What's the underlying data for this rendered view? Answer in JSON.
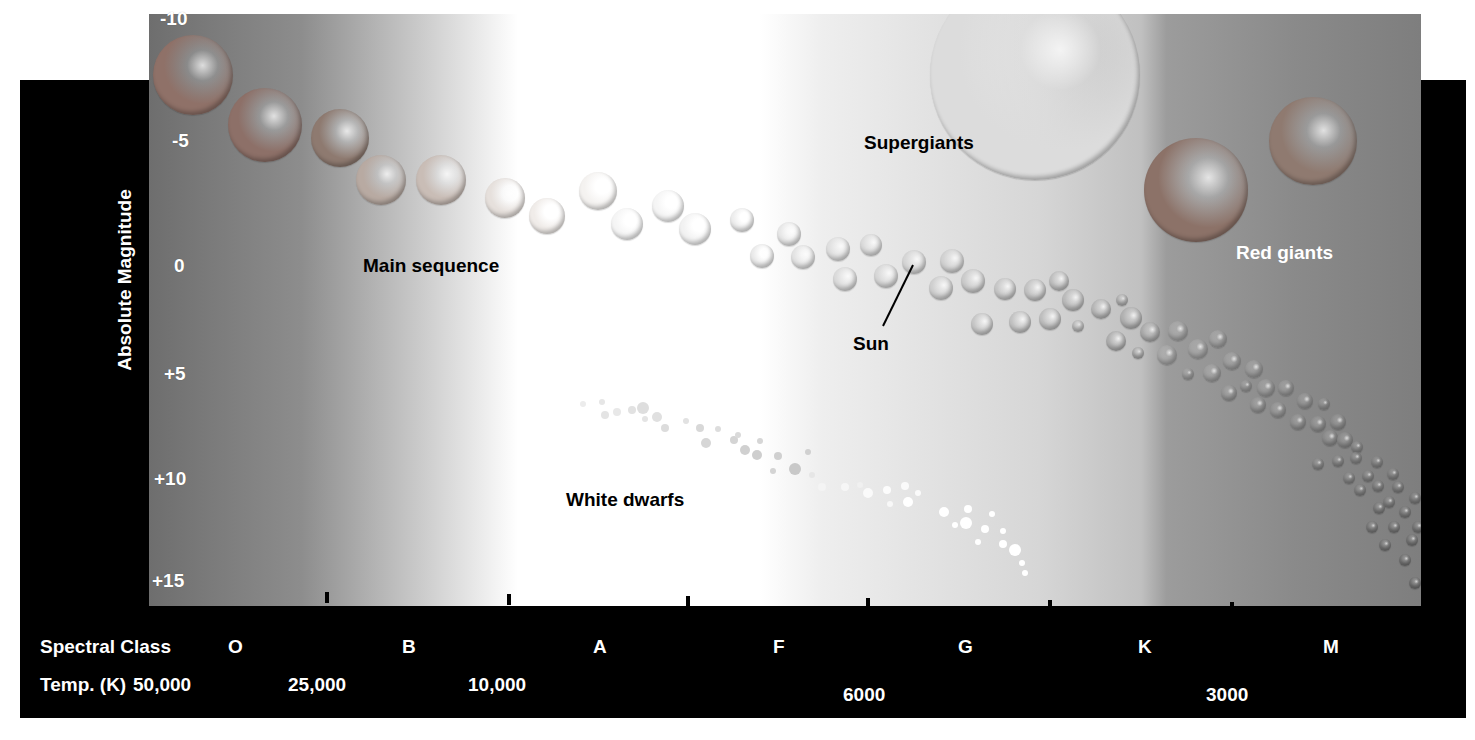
{
  "chart_data": {
    "type": "scatter",
    "ylabel": "Absolute Magnitude",
    "y_ticks": [
      "-10",
      "-5",
      "0",
      "+5",
      "+10",
      "+15"
    ],
    "y_range": [
      -10,
      15
    ],
    "y_inverted": true,
    "x_rows": [
      {
        "label": "Spectral Class",
        "ticks": [
          "O",
          "B",
          "A",
          "F",
          "G",
          "K",
          "M"
        ]
      },
      {
        "label": "Temp. (K)",
        "ticks": [
          "50,000",
          "25,000",
          "10,000",
          "6000",
          "3000"
        ]
      }
    ],
    "regions": [
      {
        "name": "Main sequence",
        "from": "upper-left (hot, bright)",
        "to": "lower-right (cool, dim)"
      },
      {
        "name": "Supergiants",
        "position": "top, G-K classes, mag ~ -10 to -5"
      },
      {
        "name": "Red giants",
        "position": "upper-right, K-M classes, mag ~ -5 to 0"
      },
      {
        "name": "White dwarfs",
        "position": "lower-middle, A-G classes, mag ~ +8 to +15"
      }
    ],
    "annotations": [
      {
        "text": "Sun",
        "spectral_class": "G",
        "magnitude": 5
      }
    ]
  },
  "axis": {
    "y_title": "Absolute Magnitude",
    "y_ticks": [
      {
        "label": "-10",
        "x": 160,
        "y": 8
      },
      {
        "label": "-5",
        "x": 172,
        "y": 130
      },
      {
        "label": "0",
        "x": 174,
        "y": 255
      },
      {
        "label": "+5",
        "x": 164,
        "y": 363
      },
      {
        "label": "+10",
        "x": 154,
        "y": 468
      },
      {
        "label": "+15",
        "x": 152,
        "y": 570
      }
    ],
    "tick_marks_x": [
      327,
      509,
      688,
      868,
      1050,
      1232
    ],
    "spectral_label": "Spectral Class",
    "spectral_classes": [
      {
        "label": "O",
        "x": 228
      },
      {
        "label": "B",
        "x": 402
      },
      {
        "label": "A",
        "x": 593
      },
      {
        "label": "F",
        "x": 773
      },
      {
        "label": "G",
        "x": 958
      },
      {
        "label": "K",
        "x": 1138
      },
      {
        "label": "M",
        "x": 1323
      }
    ],
    "temp_label": "Temp. (K)",
    "temps": [
      {
        "label": "50,000",
        "x": 133
      },
      {
        "label": "25,000",
        "x": 288
      },
      {
        "label": "10,000",
        "x": 468
      },
      {
        "label": "6000",
        "x": 843
      },
      {
        "label": "3000",
        "x": 1206
      }
    ]
  },
  "labels": {
    "main_sequence": "Main sequence",
    "supergiants": "Supergiants",
    "red_giants": "Red giants",
    "white_dwarfs": "White dwarfs",
    "sun": "Sun"
  },
  "colors": {
    "band": "#000000",
    "red_star": "#8a6a64",
    "warm_star": "#c4b4aa",
    "white_star": "#f2f2f2",
    "grey_star": "#a8a8a8",
    "dark_star": "#8c8c8c"
  },
  "stars": [
    [
      193,
      75,
      40,
      "#8f7168"
    ],
    [
      265,
      125,
      37,
      "#8d7068"
    ],
    [
      340,
      138,
      29,
      "#8e7a70"
    ],
    [
      381,
      180,
      25,
      "#b8aaa2"
    ],
    [
      441,
      180,
      25,
      "#c9bdb6"
    ],
    [
      505,
      198,
      20,
      "#e6e0dc"
    ],
    [
      547,
      216,
      18,
      "#f0ece9"
    ],
    [
      598,
      191,
      19,
      "#f4f2f0"
    ],
    [
      627,
      224,
      16,
      "#f5f5f5"
    ],
    [
      668,
      206,
      16,
      "#f5f5f5"
    ],
    [
      695,
      229,
      16,
      "#f2f2f2"
    ],
    [
      742,
      220,
      12,
      "#eeeeee"
    ],
    [
      762,
      256,
      12,
      "#ebebeb"
    ],
    [
      789,
      234,
      12,
      "#e8e8e8"
    ],
    [
      803,
      257,
      12,
      "#e4e4e4"
    ],
    [
      838,
      249,
      12,
      "#e0e0e0"
    ],
    [
      845,
      279,
      12,
      "#dcdcdc"
    ],
    [
      871,
      245,
      11,
      "#dcdcdc"
    ],
    [
      886,
      276,
      12,
      "#d8d8d8"
    ],
    [
      914,
      262,
      12,
      "#d6d6d6"
    ],
    [
      952,
      261,
      12,
      "#d2d2d2"
    ],
    [
      941,
      288,
      12,
      "#d0d0d0"
    ],
    [
      973,
      281,
      12,
      "#cccccc"
    ],
    [
      1005,
      289,
      11,
      "#c8c8c8"
    ],
    [
      1035,
      290,
      11,
      "#c4c4c4"
    ],
    [
      1059,
      281,
      10,
      "#c0c0c0"
    ],
    [
      982,
      324,
      11,
      "#c8c8c8"
    ],
    [
      1020,
      322,
      11,
      "#c4c4c4"
    ],
    [
      1050,
      319,
      11,
      "#c0c0c0"
    ],
    [
      1078,
      326,
      6,
      "#bcbcbc"
    ],
    [
      1073,
      300,
      11,
      "#bcbcbc"
    ],
    [
      1101,
      309,
      10,
      "#b8b8b8"
    ],
    [
      1122,
      300,
      6,
      "#b4b4b4"
    ],
    [
      1131,
      318,
      11,
      "#b2b2b2"
    ],
    [
      1116,
      341,
      10,
      "#b0b0b0"
    ],
    [
      1138,
      353,
      6,
      "#acacac"
    ],
    [
      1150,
      332,
      10,
      "#acacac"
    ],
    [
      1167,
      355,
      10,
      "#a8a8a8"
    ],
    [
      1178,
      331,
      10,
      "#a6a6a6"
    ],
    [
      1198,
      349,
      10,
      "#a4a4a4"
    ],
    [
      1218,
      339,
      9,
      "#a2a2a2"
    ],
    [
      1188,
      374,
      6,
      "#a0a0a0"
    ],
    [
      1212,
      373,
      9,
      "#a0a0a0"
    ],
    [
      1232,
      361,
      9,
      "#9e9e9e"
    ],
    [
      1254,
      369,
      9,
      "#9c9c9c"
    ],
    [
      1246,
      386,
      6,
      "#9a9a9a"
    ],
    [
      1266,
      388,
      9,
      "#9a9a9a"
    ],
    [
      1286,
      388,
      8,
      "#989898"
    ],
    [
      1229,
      393,
      8,
      "#989898"
    ],
    [
      1258,
      405,
      8,
      "#969696"
    ],
    [
      1278,
      410,
      8,
      "#969696"
    ],
    [
      1305,
      401,
      8,
      "#949494"
    ],
    [
      1324,
      404,
      6,
      "#929292"
    ],
    [
      1298,
      422,
      8,
      "#929292"
    ],
    [
      1318,
      424,
      8,
      "#909090"
    ],
    [
      1338,
      422,
      8,
      "#8e8e8e"
    ],
    [
      1330,
      438,
      8,
      "#8e8e8e"
    ],
    [
      1345,
      440,
      8,
      "#8c8c8c"
    ],
    [
      1357,
      447,
      6,
      "#8a8a8a"
    ],
    [
      1318,
      464,
      6,
      "#8a8a8a"
    ],
    [
      1338,
      461,
      6,
      "#888888"
    ],
    [
      1356,
      458,
      6,
      "#888888"
    ],
    [
      1377,
      462,
      6,
      "#868686"
    ],
    [
      1349,
      478,
      6,
      "#868686"
    ],
    [
      1368,
      476,
      6,
      "#848484"
    ],
    [
      1393,
      474,
      6,
      "#848484"
    ],
    [
      1360,
      490,
      6,
      "#828282"
    ],
    [
      1378,
      486,
      6,
      "#828282"
    ],
    [
      1398,
      487,
      6,
      "#808080"
    ],
    [
      1389,
      502,
      6,
      "#808080"
    ],
    [
      1415,
      498,
      6,
      "#7e7e7e"
    ],
    [
      1379,
      508,
      6,
      "#7e7e7e"
    ],
    [
      1405,
      512,
      6,
      "#7c7c7c"
    ],
    [
      1372,
      527,
      6,
      "#7c7c7c"
    ],
    [
      1394,
      527,
      6,
      "#7a7a7a"
    ],
    [
      1418,
      527,
      6,
      "#7a7a7a"
    ],
    [
      1385,
      545,
      6,
      "#787878"
    ],
    [
      1412,
      540,
      6,
      "#787878"
    ],
    [
      1405,
      560,
      6,
      "#767676"
    ],
    [
      1415,
      583,
      6,
      "#747474"
    ]
  ],
  "giants": [
    [
      1035,
      75,
      105,
      "#dcdcdc",
      "supergiant"
    ],
    [
      1196,
      190,
      52,
      "#8c7268",
      "red-giant-1"
    ],
    [
      1313,
      141,
      44,
      "#8f7a70",
      "red-giant-2"
    ]
  ],
  "white_dwarfs": [
    [
      583,
      404,
      3,
      "#ececec"
    ],
    [
      602,
      402,
      3,
      "#e6e6e6"
    ],
    [
      605,
      415,
      4,
      "#e4e4e4"
    ],
    [
      617,
      412,
      4,
      "#e8e8e8"
    ],
    [
      632,
      410,
      4,
      "#e2e2e2"
    ],
    [
      643,
      408,
      6,
      "#dedede"
    ],
    [
      657,
      417,
      5,
      "#e0e0e0"
    ],
    [
      645,
      419,
      3,
      "#e4e4e4"
    ],
    [
      665,
      428,
      4,
      "#dcdcdc"
    ],
    [
      686,
      421,
      3,
      "#e2e2e2"
    ],
    [
      700,
      428,
      4,
      "#d8d8d8"
    ],
    [
      706,
      443,
      5,
      "#d6d6d6"
    ],
    [
      718,
      429,
      3,
      "#dddddd"
    ],
    [
      734,
      440,
      4,
      "#d4d4d4"
    ],
    [
      738,
      435,
      3,
      "#dadada"
    ],
    [
      745,
      450,
      5,
      "#d0d0d0"
    ],
    [
      760,
      441,
      3,
      "#d6d6d6"
    ],
    [
      757,
      455,
      5,
      "#cecece"
    ],
    [
      778,
      456,
      4,
      "#d0d0d0"
    ],
    [
      773,
      471,
      3,
      "#d4d4d4"
    ],
    [
      795,
      469,
      6,
      "#c8c8c8"
    ],
    [
      808,
      452,
      3,
      "#d0d0d0"
    ],
    [
      812,
      475,
      3,
      "#e6e6e6"
    ],
    [
      822,
      487,
      4,
      "#f4f4f4"
    ],
    [
      845,
      487,
      4,
      "#f6f6f6"
    ],
    [
      860,
      485,
      3,
      "#f0f0f0"
    ],
    [
      868,
      493,
      5,
      "#fafafa"
    ],
    [
      887,
      490,
      4,
      "#fcfcfc"
    ],
    [
      905,
      486,
      4,
      "#fafafa"
    ],
    [
      908,
      502,
      5,
      "#ffffff"
    ],
    [
      890,
      504,
      3,
      "#f8f8f8"
    ],
    [
      918,
      493,
      3,
      "#fafafa"
    ],
    [
      944,
      512,
      5,
      "#ffffff"
    ],
    [
      968,
      509,
      4,
      "#ffffff"
    ],
    [
      955,
      525,
      3,
      "#ffffff"
    ],
    [
      966,
      523,
      6,
      "#ffffff"
    ],
    [
      985,
      529,
      4,
      "#ffffff"
    ],
    [
      992,
      514,
      3,
      "#ffffff"
    ],
    [
      978,
      542,
      3,
      "#ffffff"
    ],
    [
      1003,
      544,
      4,
      "#ffffff"
    ],
    [
      1015,
      550,
      6,
      "#ffffff"
    ],
    [
      1003,
      531,
      3,
      "#ffffff"
    ],
    [
      1022,
      563,
      3,
      "#ffffff"
    ],
    [
      1025,
      573,
      3,
      "#ffffff"
    ]
  ]
}
